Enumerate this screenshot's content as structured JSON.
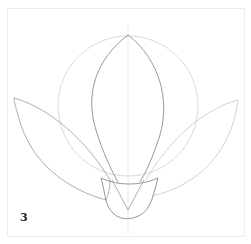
{
  "figure": {
    "step_number": "3",
    "colors": {
      "guide_line": "#d8d8d8",
      "outline": "#8a8a8a",
      "background": "#ffffff"
    }
  }
}
